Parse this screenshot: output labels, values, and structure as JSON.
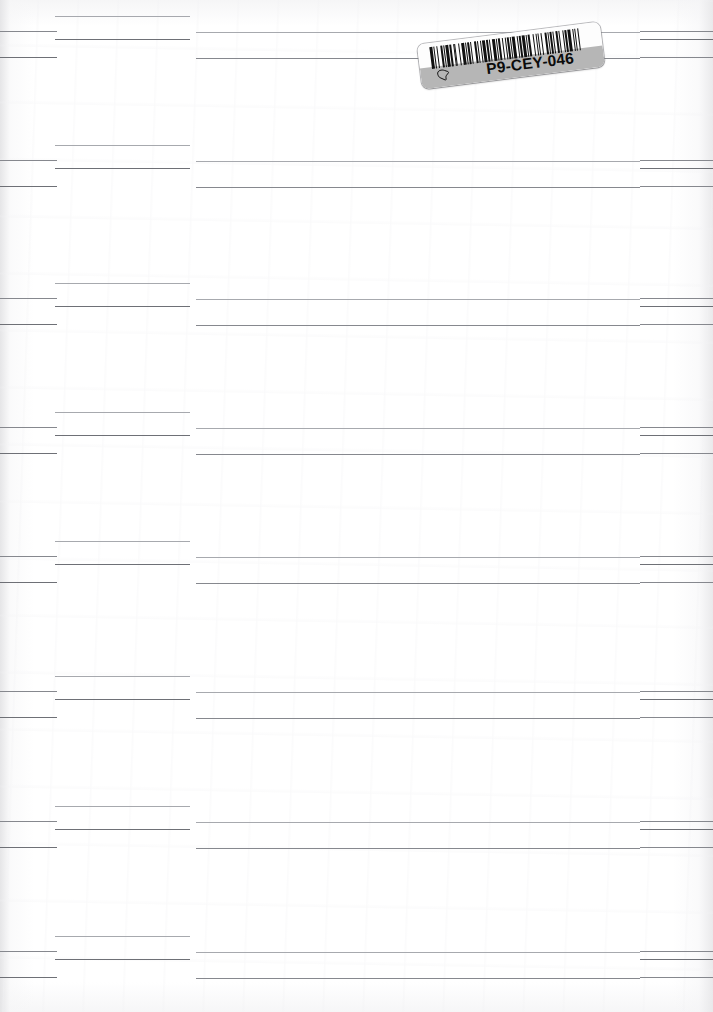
{
  "document": {
    "type": "scanned-ruled-page",
    "page_width": 713,
    "page_height": 1012,
    "background_color": "#ffffff",
    "rule_color": "#8e9096",
    "description": "Blank scanned ruled ledger page with repeating horizontal rule groups and an affixed barcode sticker"
  },
  "sticker": {
    "code": "P9-CEY-046",
    "glyph_name": "hand-pointer-glyph",
    "white_band_color": "#fdfdfd",
    "gray_band_color": "#b6b6b6",
    "bar_color": "#111111",
    "rotation_degrees": -7.2,
    "barcode_pattern": [
      3,
      1,
      1,
      2,
      1,
      3,
      2,
      1,
      1,
      1,
      3,
      1,
      2,
      2,
      1,
      1,
      1,
      3,
      1,
      2,
      3,
      1,
      1,
      1,
      2,
      1,
      1,
      3,
      2,
      1,
      1,
      2,
      1,
      1,
      3,
      1,
      2,
      1,
      1,
      2,
      3,
      1,
      1,
      1,
      2,
      2,
      1,
      3,
      1,
      1,
      2,
      1,
      1,
      1,
      3,
      2,
      1,
      1,
      2,
      1,
      3,
      1,
      1,
      1,
      2,
      3,
      1,
      2,
      1,
      1,
      1,
      2,
      1,
      3,
      2,
      1,
      1,
      1,
      3,
      1,
      1,
      2,
      2,
      1,
      1,
      3,
      1,
      1,
      2,
      1,
      3,
      2,
      1,
      1,
      1,
      2,
      1,
      1
    ]
  },
  "line_groups": [
    {
      "index": 0,
      "top": 16,
      "rows": [
        {
          "name": "col2-rule-a",
          "x": 55,
          "width": 135,
          "weight": "thin",
          "dy": 0
        },
        {
          "name": "col1-rule-a",
          "x": 0,
          "width": 57,
          "weight": "medium",
          "dy": 15
        },
        {
          "name": "center-rule-a",
          "x": 196,
          "width": 444,
          "weight": "thin",
          "dy": 16
        },
        {
          "name": "col4-rule-a",
          "x": 640,
          "width": 73,
          "weight": "medium",
          "dy": 15
        },
        {
          "name": "col2-rule-b",
          "x": 55,
          "width": 135,
          "weight": "heavy",
          "dy": 23
        },
        {
          "name": "col4-rule-b",
          "x": 640,
          "width": 73,
          "weight": "heavy",
          "dy": 23
        },
        {
          "name": "col1-rule-b",
          "x": 0,
          "width": 57,
          "weight": "heavy",
          "dy": 41
        },
        {
          "name": "center-rule-b",
          "x": 196,
          "width": 444,
          "weight": "medium",
          "dy": 42
        },
        {
          "name": "col4-rule-c",
          "x": 640,
          "width": 73,
          "weight": "medium",
          "dy": 41
        }
      ]
    },
    {
      "index": 1,
      "top": 145
    },
    {
      "index": 2,
      "top": 283
    },
    {
      "index": 3,
      "top": 412
    },
    {
      "index": 4,
      "top": 541
    },
    {
      "index": 5,
      "top": 676
    },
    {
      "index": 6,
      "top": 806
    },
    {
      "index": 7,
      "top": 936
    }
  ]
}
